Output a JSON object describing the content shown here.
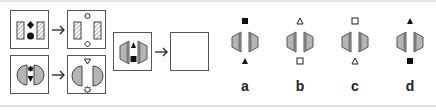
{
  "puzzle": {
    "example_rows": [
      {
        "source": {
          "shapes": "hatched-rectangles",
          "top_symbol": "filled-diamond",
          "bottom_symbol": "filled-circle"
        },
        "result": {
          "shapes": "hatched-rectangles",
          "top_symbol": "hollow-circle",
          "bottom_symbol": "hollow-diamond"
        }
      },
      {
        "source": {
          "shapes": "gray-half-circles",
          "top_symbol": "filled-star",
          "bottom_symbol": "filled-triangle-down"
        },
        "result": {
          "shapes": "gray-half-circles",
          "top_symbol": "hollow-triangle-down",
          "bottom_symbol": "hollow-star"
        }
      }
    ],
    "question": {
      "source": {
        "shapes": "gray-trapezoids",
        "top_symbol": "filled-triangle-up",
        "bottom_symbol": "filled-square"
      },
      "result": "empty"
    },
    "options": [
      {
        "label": "a",
        "top_symbol": "filled-square",
        "bottom_symbol": "filled-triangle-up"
      },
      {
        "label": "b",
        "top_symbol": "hollow-triangle-up",
        "bottom_symbol": "hollow-square"
      },
      {
        "label": "c",
        "top_symbol": "hollow-square",
        "bottom_symbol": "hollow-triangle-up"
      },
      {
        "label": "d",
        "top_symbol": "filled-triangle-up",
        "bottom_symbol": "filled-square"
      }
    ],
    "colors": {
      "border": "#555555",
      "shape_fill": "#b5b5b5",
      "shape_dark": "#7a7a7a",
      "symbol": "#111111"
    }
  }
}
